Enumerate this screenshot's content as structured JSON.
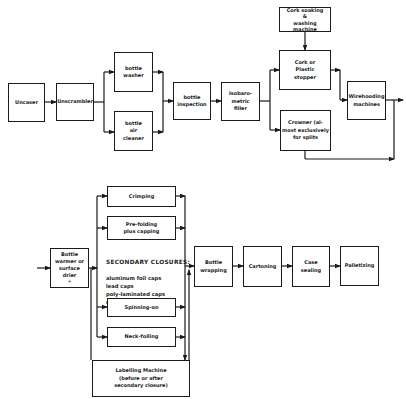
{
  "diagram": {
    "type": "process-flowchart",
    "top_row": {
      "uncaser": "Uncaser",
      "unscrambler": "Unscrambler",
      "bottle_washer": "bottle\nwasher",
      "bottle_air_cleaner": "bottle\nair\ncleaner",
      "bottle_inspection": "bottle\ninspection",
      "isobarometric_filler": "Isobaro-\nmetric\nfiller",
      "cork_soaking": "Cork soaking\n&\nwashing machine",
      "cork_stopper": "Cork or\nPlastic\nstopper",
      "crowner": "Crowner (al-\nmost exclusively\nfor splits",
      "wirehooding": "Wirehooding\nmachines"
    },
    "bottom_row": {
      "bottle_warmer": "Bottle\nwarmer or\nsurface drier\n*",
      "crimping": "Crimping",
      "pre_folding": "Pre-folding\nplus capping",
      "secondary_closures_title": "SECONDARY CLOSURES:",
      "secondary_closures_items": "aluminum foil caps\nlead caps\npoly-laminated caps\nneck foil",
      "spinning_on": "Spinning-on",
      "neck_foiling": "Neck-foiling",
      "labelling_machine": "Labelling Machine\n(before or after\nsecondary closure)",
      "bottle_wrapping": "Bottle\nwrapping",
      "cartoning": "Cartoning",
      "case_sealing": "Case\nsealing",
      "palletizing": "Palletizing"
    },
    "line_color": "#1a1a1a"
  }
}
